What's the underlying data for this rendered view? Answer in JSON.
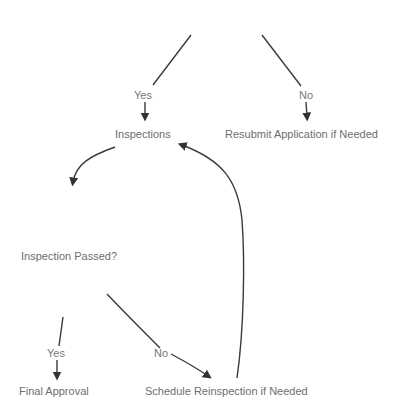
{
  "diagram": {
    "type": "flowchart",
    "colors": {
      "text": "#6e6e6e",
      "edge": "#3a3a3a",
      "background": "#ffffff"
    },
    "nodes": [
      {
        "id": "inspections",
        "label": "Inspections"
      },
      {
        "id": "resubmit",
        "label": "Resubmit Application if Needed"
      },
      {
        "id": "passed",
        "label": "Inspection Passed?"
      },
      {
        "id": "final",
        "label": "Final Approval"
      },
      {
        "id": "reinspect",
        "label": "Schedule Reinspection if Needed"
      }
    ],
    "edges": [
      {
        "from": "(above)",
        "to": "inspections",
        "label": "Yes"
      },
      {
        "from": "(above)",
        "to": "resubmit",
        "label": "No"
      },
      {
        "from": "inspections",
        "to": "passed",
        "label": ""
      },
      {
        "from": "passed",
        "to": "final",
        "label": "Yes"
      },
      {
        "from": "passed",
        "to": "reinspect",
        "label": "No"
      },
      {
        "from": "reinspect",
        "to": "inspections",
        "label": ""
      }
    ]
  }
}
